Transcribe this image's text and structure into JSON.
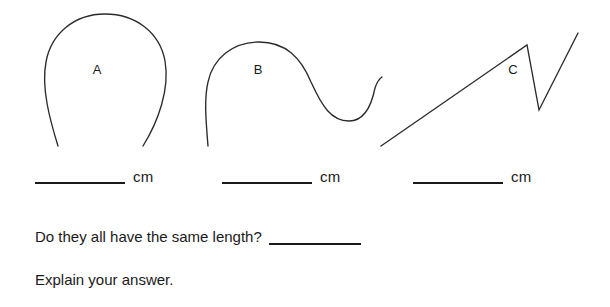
{
  "worksheet": {
    "curves": [
      {
        "id": "curve-a",
        "label": "A",
        "shape": "open-arch",
        "label_x": 97,
        "label_y": 74,
        "path": "M 58 146 C 50 120 41 88 46 62 C 51 34 74 14 105 14 C 136 14 160 33 165 61 C 170 89 158 122 143 146"
      },
      {
        "id": "curve-b",
        "label": "B",
        "shape": "wave",
        "label_x": 258,
        "label_y": 74,
        "path": "M 208 146 C 206 122 204 99 208 82 C 213 58 233 42 259 42 C 286 42 301 58 311 82 C 322 106 331 121 349 121 C 365 121 372 103 375 88 C 377 82 379 79 382 77"
      },
      {
        "id": "curve-c",
        "label": "C",
        "shape": "zigzag",
        "label_x": 513,
        "label_y": 74,
        "path": "M 381 146 L 527 45 L 539 110 L 578 33"
      }
    ],
    "measurement_blanks": [
      {
        "id": "blank-a",
        "value": "",
        "unit": "cm"
      },
      {
        "id": "blank-b",
        "value": "",
        "unit": "cm"
      },
      {
        "id": "blank-c",
        "value": "",
        "unit": "cm"
      }
    ],
    "questions": {
      "same_length": "Do they all have the same length?",
      "same_length_answer": "",
      "explain": "Explain your answer."
    }
  }
}
